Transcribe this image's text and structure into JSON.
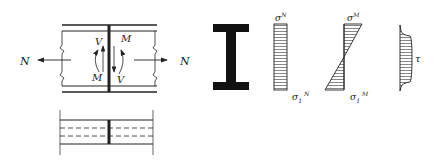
{
  "figure": {
    "beam_elevation": {
      "force_left": "N",
      "force_right": "N",
      "shear_left": "V",
      "shear_right": "V",
      "moment_left": "M",
      "moment_right": "M"
    },
    "beam_plan": {},
    "section": {
      "shape": "I-section"
    },
    "stress_N": {
      "top_label": "σ",
      "top_sup": "N",
      "bottom_label": "σ",
      "bottom_sub": "1",
      "bottom_sup": "N"
    },
    "stress_M": {
      "top_label": "σ",
      "top_sup": "M",
      "bottom_label": "σ",
      "bottom_sub": "1",
      "bottom_sup": "M"
    },
    "stress_tau": {
      "label": "τ"
    }
  },
  "colors": {
    "line": "#222222",
    "background": "#ffffff"
  }
}
